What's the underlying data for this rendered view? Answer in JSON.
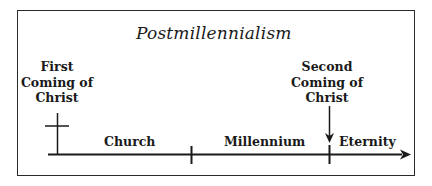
{
  "title": "Postmillennialism",
  "events": [
    {
      "id": "first-coming",
      "lines": [
        "First",
        "Coming of",
        "Christ"
      ],
      "marker": "cross"
    },
    {
      "id": "second-coming",
      "lines": [
        "Second",
        "Coming of",
        "Christ"
      ],
      "marker": "down-arrow"
    }
  ],
  "periods": [
    {
      "id": "church",
      "label": "Church"
    },
    {
      "id": "millennium",
      "label": "Millennium"
    },
    {
      "id": "eternity",
      "label": "Eternity"
    }
  ],
  "colors": {
    "line": "#1a1a1a",
    "text": "#1a1a1a",
    "background": "#ffffff"
  }
}
